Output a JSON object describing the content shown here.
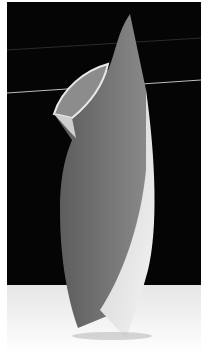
{
  "image": {
    "subject": "abstract white sculpture photograph",
    "width": 208,
    "height": 358,
    "colors": {
      "background": "#050505",
      "sculpture_gray": "#6e6e6e",
      "sculpture_light": "#d8d8d8",
      "highlight": "#f2f2f2",
      "floor": "#ffffff",
      "line": "#bdbdbd"
    }
  }
}
